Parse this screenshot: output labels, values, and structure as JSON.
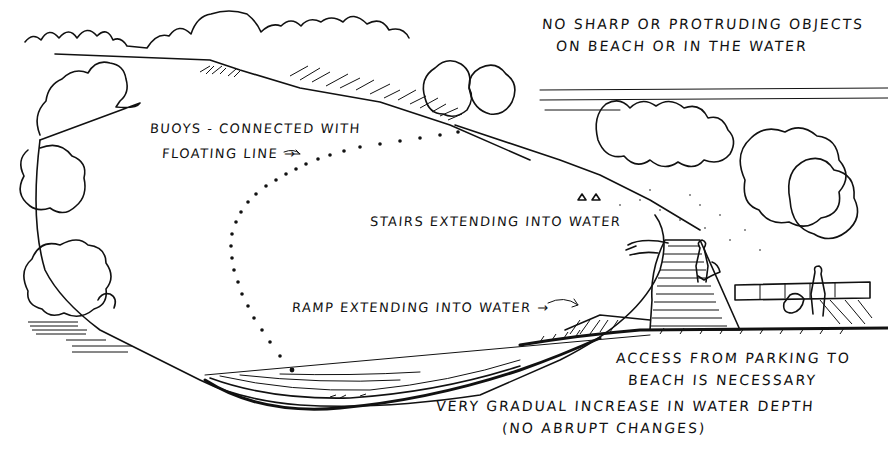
{
  "diagram": {
    "style": "black ink pen sketch on white",
    "colors": {
      "ink": "#111111",
      "paper": "#ffffff"
    },
    "annotations": {
      "no_sharp_objects_line1": "NO SHARP OR PROTRUDING OBJECTS",
      "no_sharp_objects_line2": "ON BEACH OR IN THE WATER",
      "buoys_line1": "BUOYS - CONNECTED WITH",
      "buoys_line2": "FLOATING LINE →",
      "stairs": "STAIRS EXTENDING  INTO WATER",
      "ramp": "RAMP EXTENDING INTO WATER →",
      "access_line1": "ACCESS FROM PARKING TO",
      "access_line2": "BEACH IS NECESSARY",
      "depth_line1": "VERY GRADUAL  INCREASE IN WATER DEPTH",
      "depth_line2": "(NO ABRUPT CHANGES)"
    },
    "elements": [
      "tree-line-background",
      "lake-water-area",
      "buoy-line-dotted",
      "stairs-into-water",
      "ramp-into-water",
      "parking-wall",
      "people-figures",
      "shoreline-gradual-depth-section"
    ]
  }
}
